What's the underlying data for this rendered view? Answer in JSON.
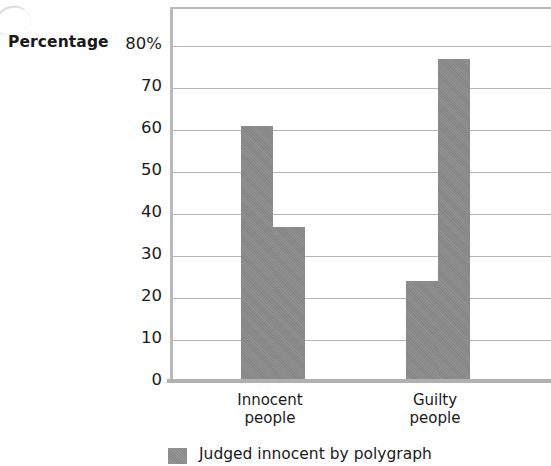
{
  "chart_data": {
    "type": "bar",
    "title": "",
    "subtitle": "",
    "xlabel": "",
    "ylabel": "Percentage",
    "categories": [
      "Innocent people",
      "Guilty people"
    ],
    "category_lines": [
      [
        "Innocent",
        "people"
      ],
      [
        "Guilty",
        "people"
      ]
    ],
    "series": [
      {
        "name": "Judged innocent by polygraph",
        "values": [
          61,
          24
        ]
      },
      {
        "name": "",
        "values": [
          37,
          77
        ]
      }
    ],
    "ylim": [
      0,
      80
    ],
    "ytick_values": [
      80,
      70,
      60,
      50,
      40,
      30,
      20,
      10,
      0
    ],
    "ytick_labels": [
      "80%",
      "70",
      "60",
      "50",
      "40",
      "30",
      "20",
      "10",
      "0"
    ],
    "grid": true,
    "grid_axis": "y",
    "legend_position": "bottom-left",
    "bar_color": "#8a8a8a",
    "gridline_color": "#b5b5b5",
    "axis_color": "#b9b9b9",
    "note": "Right-hand portion of the plot and the lower legend rows are cropped by the image edge."
  },
  "axis": {
    "y_title": "Percentage"
  },
  "legend": {
    "entries": [
      {
        "label": "Judged innocent by polygraph",
        "color": "#8f8f8f"
      }
    ]
  }
}
